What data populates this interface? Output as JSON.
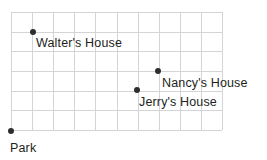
{
  "diagram": {
    "type": "coordinate-grid-map",
    "title": "",
    "grid": {
      "x": 11,
      "y": 12,
      "width": 211,
      "height": 118,
      "columns": 10,
      "rows": 6,
      "cell_width": 21.1,
      "cell_height": 19.67,
      "line_color": "#d4d4d4",
      "show_grid": true
    },
    "background_color": "#ffffff",
    "point_color": "#2e2e2e",
    "label_color": "#231f20",
    "points": [
      {
        "id": "walters-house",
        "label": "Walter's House",
        "px": 33,
        "py": 32,
        "grid_col": 1,
        "grid_row": 1,
        "label_px": 36,
        "label_py": 43,
        "label_anchor": "left"
      },
      {
        "id": "nancys-house",
        "label": "Nancy's House",
        "px": 158,
        "py": 71,
        "grid_col": 7,
        "grid_row": 3,
        "label_px": 162,
        "label_py": 83,
        "label_anchor": "left"
      },
      {
        "id": "jerrys-house",
        "label": "Jerry's House",
        "px": 137,
        "py": 90,
        "grid_col": 6,
        "grid_row": 4,
        "label_px": 139,
        "label_py": 102,
        "label_anchor": "left"
      },
      {
        "id": "park",
        "label": "Park",
        "px": 11,
        "py": 131,
        "grid_col": 0,
        "grid_row": 6,
        "label_px": 10,
        "label_py": 148,
        "label_anchor": "left"
      }
    ]
  }
}
